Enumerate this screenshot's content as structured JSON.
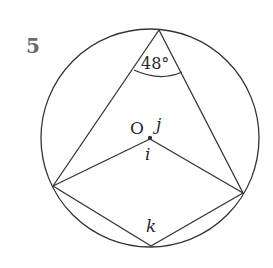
{
  "question_number": "5",
  "diagram": {
    "circle": {
      "cx": 150,
      "cy": 138,
      "r": 109
    },
    "points": {
      "top": [
        159,
        30
      ],
      "left": [
        53,
        186
      ],
      "right": [
        243,
        193
      ],
      "bottom": [
        151,
        246
      ],
      "center": [
        150,
        137
      ]
    },
    "labels": {
      "angle_top": "48°",
      "center": "O",
      "j": "j",
      "i": "i",
      "k": "k"
    }
  }
}
